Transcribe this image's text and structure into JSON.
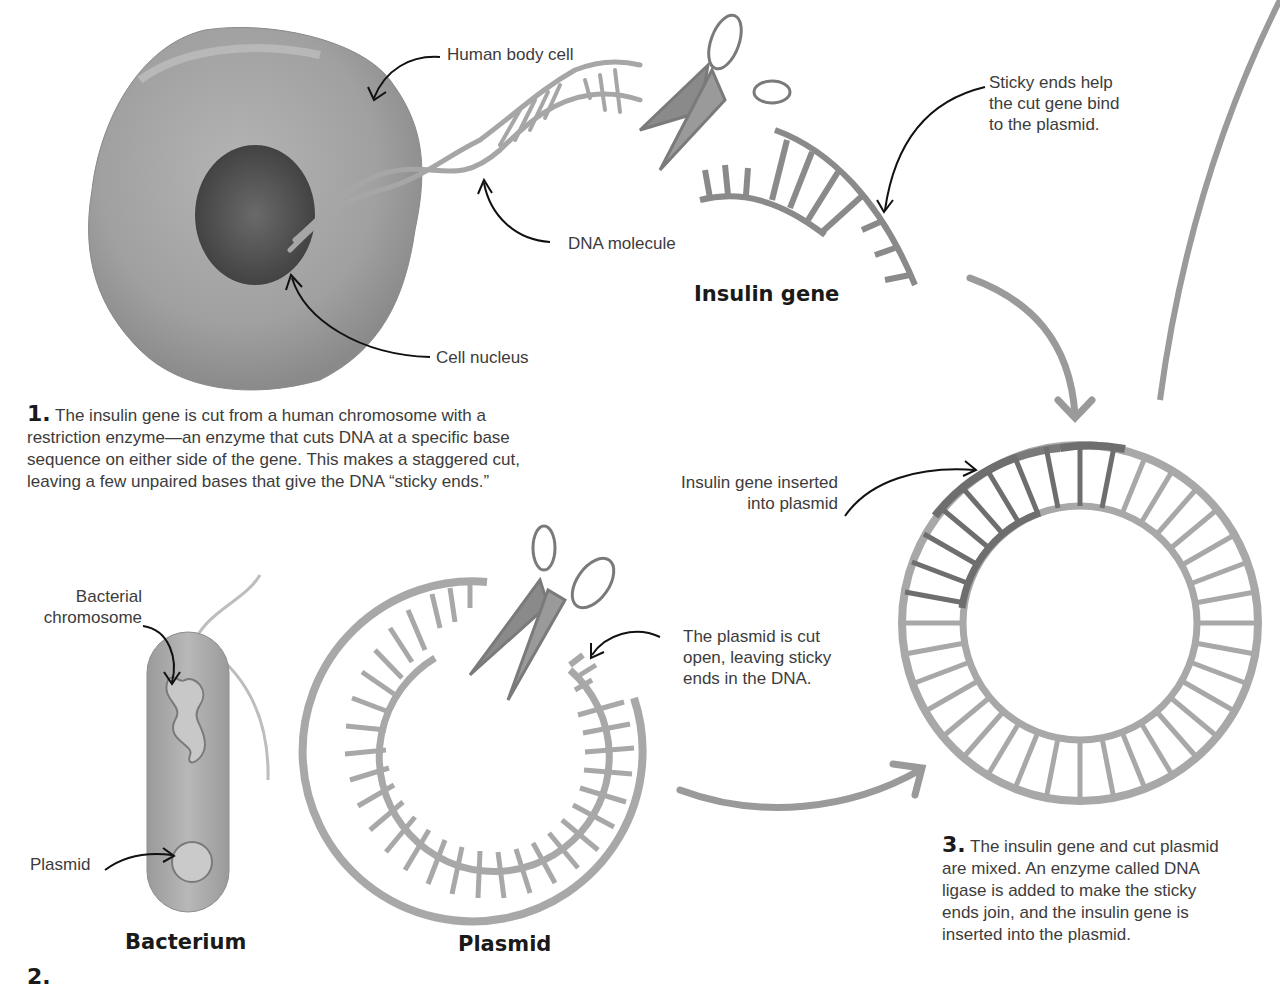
{
  "labels": {
    "human_body_cell": "Human body cell",
    "dna_molecule": "DNA molecule",
    "cell_nucleus": "Cell nucleus",
    "sticky_ends": [
      "Sticky ends help",
      "the cut gene bind",
      "to the plasmid."
    ],
    "insulin_gene_inserted": [
      "Insulin gene inserted",
      "into plasmid"
    ],
    "bacterial_chromosome": [
      "Bacterial",
      "chromosome"
    ],
    "plasmid_small": "Plasmid",
    "plasmid_cut": [
      "The plasmid is cut",
      "open, leaving sticky",
      "ends in the DNA."
    ]
  },
  "titles": {
    "insulin_gene": "Insulin gene",
    "bacterium": "Bacterium",
    "plasmid": "Plasmid"
  },
  "steps": {
    "step1": {
      "number": "1.",
      "text": "The insulin gene is cut from a human chromosome with a restriction enzyme—an enzyme that cuts DNA at a specific base sequence on either side of the gene. This makes a staggered cut, leaving a few unpaired bases that give the DNA “sticky ends.”"
    },
    "step2": {
      "number": "2."
    },
    "step3": {
      "number": "3.",
      "text": "The insulin gene and cut plasmid are mixed. An enzyme called DNA ligase is added to make the sticky ends join, and the insulin gene is inserted into the plasmid."
    }
  },
  "colors": {
    "dna_gray": "#a8a8a8",
    "gene_dark": "#6e6e6e",
    "arrow_gray": "#9a9a9a",
    "cell_gray": "#9c9c9c",
    "nucleus": "#555555"
  }
}
